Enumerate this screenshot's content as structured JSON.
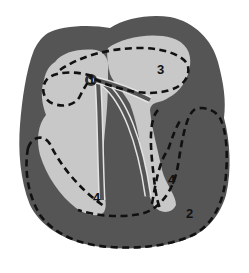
{
  "diagram": {
    "type": "heart cross-section schematic",
    "colors": {
      "background": "#ffffff",
      "myocardium": "#555555",
      "chamber": "#c8c8c8",
      "outline": "#111111"
    },
    "labels": [
      {
        "id": "label-1",
        "text": "1"
      },
      {
        "id": "label-2",
        "text": "2"
      },
      {
        "id": "label-3",
        "text": "3"
      },
      {
        "id": "label-4-left",
        "text": "4"
      },
      {
        "id": "label-4-right",
        "text": "4"
      }
    ]
  }
}
